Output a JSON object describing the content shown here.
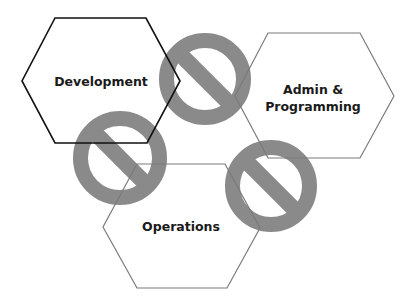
{
  "diagram": {
    "title": "",
    "colors": {
      "background": "#ffffff",
      "prohibition_symbol": "#8a8a8a",
      "development_stroke": "#111111",
      "other_stroke": "#7a7a7a",
      "label_text": "#1a1a1a"
    },
    "hexagons": [
      {
        "id": "development",
        "label_lines": [
          "Development"
        ],
        "points": [
          [
            55,
            18
          ],
          [
            146,
            18
          ],
          [
            180,
            81
          ],
          [
            147,
            143
          ],
          [
            55,
            143
          ],
          [
            22,
            81
          ]
        ],
        "stroke": "#111111",
        "label_center": [
          101,
          81
        ]
      },
      {
        "id": "admin-programming",
        "label_lines": [
          "Admin &",
          "Programming"
        ],
        "points": [
          [
            268,
            33
          ],
          [
            360,
            33
          ],
          [
            394,
            96
          ],
          [
            360,
            158
          ],
          [
            268,
            158
          ],
          [
            235,
            96
          ]
        ],
        "stroke": "#7a7a7a",
        "label_center": [
          313,
          98
        ]
      },
      {
        "id": "operations",
        "label_lines": [
          "Operations"
        ],
        "points": [
          [
            137,
            164
          ],
          [
            225,
            164
          ],
          [
            260,
            228
          ],
          [
            227,
            288
          ],
          [
            137,
            288
          ],
          [
            103,
            227
          ]
        ],
        "stroke": "#7a7a7a",
        "label_center": [
          181,
          226
        ]
      }
    ],
    "prohibition_symbols": [
      {
        "id": "between-development-and-admin",
        "cx": 205,
        "cy": 79,
        "r": 46
      },
      {
        "id": "between-development-and-operations",
        "cx": 120,
        "cy": 158,
        "r": 47
      },
      {
        "id": "between-admin-and-operations",
        "cx": 271,
        "cy": 186,
        "r": 46
      }
    ]
  }
}
